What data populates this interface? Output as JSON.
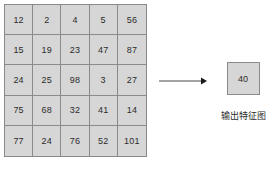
{
  "diagram": {
    "type": "cnn-pooling-illustration",
    "colors": {
      "cell_fill": "#d6d6d6",
      "cell_border": "#8a8a8a",
      "text": "#2b2b2b",
      "background": "#ffffff"
    },
    "input_grid": {
      "rows": 5,
      "cols": 5,
      "values": [
        [
          12,
          2,
          4,
          5,
          56
        ],
        [
          15,
          19,
          23,
          47,
          87
        ],
        [
          24,
          25,
          98,
          3,
          27
        ],
        [
          75,
          68,
          32,
          41,
          14
        ],
        [
          77,
          24,
          76,
          52,
          101
        ]
      ]
    },
    "arrow": {
      "direction": "right",
      "label": ""
    },
    "output": {
      "value": "40",
      "caption": "输出特征图"
    }
  }
}
